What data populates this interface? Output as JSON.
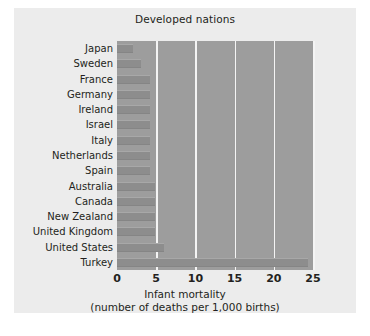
{
  "chart_data": {
    "type": "bar",
    "orientation": "horizontal",
    "title": "Developed nations",
    "xlabel_line1": "Infant mortality",
    "xlabel_line2": "(number of deaths per 1,000 births)",
    "ylabel": "",
    "xlim": [
      0,
      25
    ],
    "xticks": [
      0,
      5,
      10,
      15,
      20,
      25
    ],
    "xtick_labels": [
      "0",
      "5",
      "10",
      "15",
      "20",
      "25"
    ],
    "grid": "vertical gridlines at each x tick",
    "legend": "none",
    "categories": [
      "Japan",
      "Sweden",
      "France",
      "Germany",
      "Ireland",
      "Israel",
      "Italy",
      "Netherlands",
      "Spain",
      "Australia",
      "Canada",
      "New Zealand",
      "United Kingdom",
      "United States",
      "Turkey"
    ],
    "values": [
      2.0,
      3.0,
      4.2,
      4.2,
      4.2,
      4.2,
      4.2,
      4.2,
      4.2,
      4.9,
      4.9,
      4.9,
      4.9,
      6.0,
      24.4
    ],
    "colors": {
      "figure_background": "#ececec",
      "plot_background": "#9d9d9d",
      "bar": "#8d8d8d",
      "gridline": "#f4f4f4",
      "text": "#231f20"
    }
  }
}
